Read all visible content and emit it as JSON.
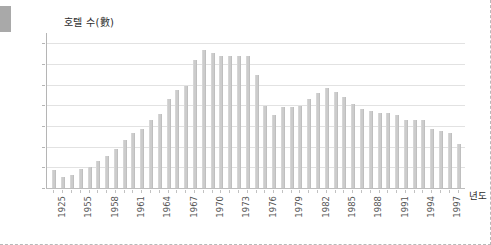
{
  "chart_data": {
    "type": "bar",
    "title": "",
    "ylabel": "호텔 수(數)",
    "xlabel": "년도",
    "ylim": [
      0,
      150
    ],
    "yticks": [
      0,
      20,
      40,
      60,
      80,
      100,
      120,
      140
    ],
    "grid": true,
    "legend": null,
    "bar_color": "#cccccc",
    "categories": [
      "1925",
      "1953",
      "1954",
      "1955",
      "1956",
      "1957",
      "1958",
      "1959",
      "1960",
      "1961",
      "1962",
      "1963",
      "1964",
      "1965",
      "1966",
      "1967",
      "1968",
      "1969",
      "1970",
      "1971",
      "1972",
      "1973",
      "1974",
      "1975",
      "1976",
      "1977",
      "1978",
      "1979",
      "1980",
      "1981",
      "1982",
      "1983",
      "1984",
      "1985",
      "1986",
      "1987",
      "1988",
      "1989",
      "1990",
      "1991",
      "1992",
      "1993",
      "1994",
      "1995",
      "1996",
      "1997",
      "1998"
    ],
    "xtick_labels": [
      "1925",
      "1955",
      "1958",
      "1961",
      "1964",
      "1967",
      "1970",
      "1973",
      "1976",
      "1979",
      "1982",
      "1985",
      "1988",
      "1991",
      "1994",
      "1997"
    ],
    "values": [
      17,
      11,
      13,
      18,
      20,
      26,
      31,
      38,
      46,
      53,
      57,
      66,
      72,
      86,
      95,
      99,
      124,
      134,
      131,
      128,
      128,
      128,
      128,
      109,
      79,
      71,
      78,
      78,
      79,
      86,
      92,
      97,
      93,
      88,
      81,
      76,
      75,
      73,
      73,
      71,
      66,
      66,
      66,
      57,
      55,
      53,
      43
    ]
  },
  "axis": {
    "y_title": "호텔 수(數)",
    "x_title": "년도"
  },
  "icons": {
    "corner_block": "grey-block-icon"
  }
}
